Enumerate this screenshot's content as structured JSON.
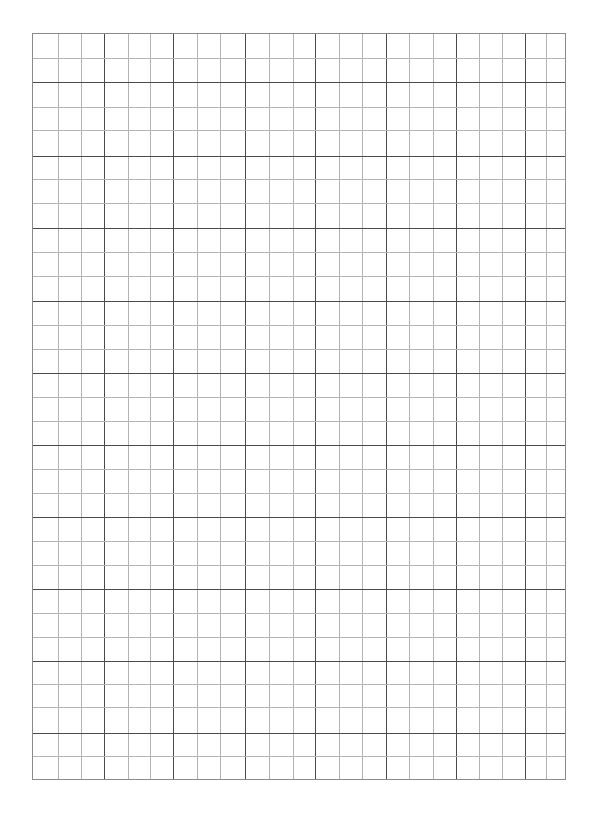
{
  "page": {
    "type": "graph-paper",
    "background": "#ffffff"
  },
  "grid": {
    "left": 32,
    "top": 33,
    "width": 534,
    "height": 747,
    "border_color": "#8a8a8a",
    "minor_color": "#b4b4b4",
    "major_color": "#4a4a4a",
    "columns": 23,
    "rows": 31,
    "vertical_lines": [
      {
        "x": 25,
        "major": false
      },
      {
        "x": 48,
        "major": false
      },
      {
        "x": 71,
        "major": true
      },
      {
        "x": 95,
        "major": false
      },
      {
        "x": 117,
        "major": false
      },
      {
        "x": 140,
        "major": true
      },
      {
        "x": 164,
        "major": false
      },
      {
        "x": 187,
        "major": false
      },
      {
        "x": 212,
        "major": true
      },
      {
        "x": 236,
        "major": false
      },
      {
        "x": 260,
        "major": false
      },
      {
        "x": 282,
        "major": true
      },
      {
        "x": 306,
        "major": false
      },
      {
        "x": 329,
        "major": false
      },
      {
        "x": 353,
        "major": true
      },
      {
        "x": 376,
        "major": false
      },
      {
        "x": 400,
        "major": false
      },
      {
        "x": 423,
        "major": true
      },
      {
        "x": 446,
        "major": false
      },
      {
        "x": 469,
        "major": false
      },
      {
        "x": 492,
        "major": true
      },
      {
        "x": 513,
        "major": false
      }
    ],
    "horizontal_lines": [
      {
        "y": 24,
        "major": false
      },
      {
        "y": 48,
        "major": true
      },
      {
        "y": 73,
        "major": false
      },
      {
        "y": 96,
        "major": false
      },
      {
        "y": 122,
        "major": true
      },
      {
        "y": 145,
        "major": false
      },
      {
        "y": 169,
        "major": false
      },
      {
        "y": 194,
        "major": true
      },
      {
        "y": 218,
        "major": false
      },
      {
        "y": 242,
        "major": false
      },
      {
        "y": 267,
        "major": true
      },
      {
        "y": 291,
        "major": false
      },
      {
        "y": 315,
        "major": false
      },
      {
        "y": 339,
        "major": true
      },
      {
        "y": 363,
        "major": false
      },
      {
        "y": 387,
        "major": false
      },
      {
        "y": 411,
        "major": true
      },
      {
        "y": 435,
        "major": false
      },
      {
        "y": 459,
        "major": false
      },
      {
        "y": 483,
        "major": true
      },
      {
        "y": 507,
        "major": false
      },
      {
        "y": 531,
        "major": false
      },
      {
        "y": 555,
        "major": true
      },
      {
        "y": 579,
        "major": false
      },
      {
        "y": 603,
        "major": false
      },
      {
        "y": 627,
        "major": true
      },
      {
        "y": 650,
        "major": false
      },
      {
        "y": 673,
        "major": false
      },
      {
        "y": 699,
        "major": true
      },
      {
        "y": 722,
        "major": false
      }
    ]
  }
}
